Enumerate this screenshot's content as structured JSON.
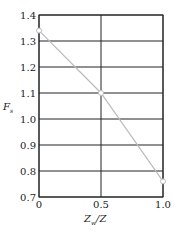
{
  "chart_data": {
    "type": "line",
    "title": "",
    "xlabel": "Z_w/Z",
    "ylabel": "F_s",
    "xlim": [
      0,
      1.0
    ],
    "ylim": [
      0.7,
      1.4
    ],
    "grid": true,
    "x_ticks": [
      "0",
      "0.5",
      "1.0"
    ],
    "y_ticks": [
      "0.7",
      "0.8",
      "0.9",
      "1.0",
      "1.1",
      "1.2",
      "1.3",
      "1.4"
    ],
    "series": [
      {
        "name": "F_s",
        "x": [
          0,
          0.5,
          1.0
        ],
        "values": [
          1.34,
          1.1,
          0.76
        ],
        "color": "#bbbbbb",
        "marker": "circle"
      }
    ],
    "legend": null
  },
  "labels": {
    "x_main": "Z",
    "x_sub": "w",
    "x_tail": "/Z",
    "y_main": "F",
    "y_sub": "s"
  }
}
